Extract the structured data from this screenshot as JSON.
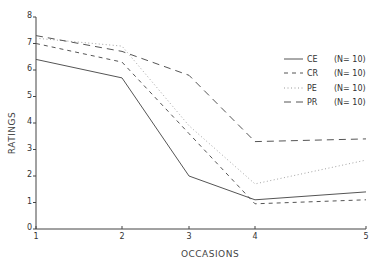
{
  "chart_data": {
    "type": "line",
    "title": "",
    "xlabel": "OCCASIONS",
    "ylabel": "RATINGS",
    "x": [
      1,
      2,
      3,
      4,
      5
    ],
    "x_tick_labels": [
      "1",
      "2",
      "3",
      "4",
      "5"
    ],
    "y_tick_labels": [
      "0",
      "1",
      "2",
      "3",
      "4",
      "5",
      "6",
      "7",
      "8"
    ],
    "ylim": [
      0,
      8
    ],
    "grid": false,
    "legend_position": "upper right",
    "series": [
      {
        "name": "CE",
        "n_label": "(N= 10)",
        "style": "solid",
        "values": [
          6.4,
          5.7,
          2.0,
          1.1,
          1.4
        ]
      },
      {
        "name": "CR",
        "n_label": "(N= 10)",
        "style": "short-dash",
        "values": [
          7.0,
          6.3,
          3.6,
          0.95,
          1.1
        ]
      },
      {
        "name": "PE",
        "n_label": "(N= 10)",
        "style": "dotted",
        "values": [
          7.2,
          6.9,
          3.9,
          1.7,
          2.6
        ]
      },
      {
        "name": "PR",
        "n_label": "(N= 10)",
        "style": "long-dash",
        "values": [
          7.3,
          6.7,
          5.8,
          3.3,
          3.4
        ]
      }
    ]
  },
  "colors": {
    "line": "#555555",
    "axis": "#444444",
    "background": "#ffffff"
  }
}
